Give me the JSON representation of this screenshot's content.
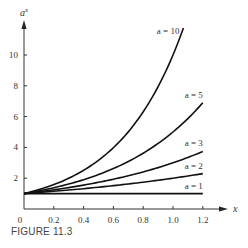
{
  "caption": "FIGURE 11.3",
  "chart_data": {
    "type": "line",
    "title": "",
    "xlabel": "x",
    "ylabel": "a^x",
    "xlim": [
      0,
      1.2
    ],
    "ylim": [
      0,
      12
    ],
    "x_ticks": [
      "0",
      "0.2",
      "0.4",
      "0.6",
      "0.8",
      "1.0",
      "1.2"
    ],
    "y_ticks": [
      "2",
      "4",
      "6",
      "8",
      "10"
    ],
    "grid": false,
    "legend": "inline labels at curve ends",
    "series": [
      {
        "name": "a = 1",
        "base": 1,
        "x": [
          0,
          0.2,
          0.4,
          0.6,
          0.8,
          1.0,
          1.2
        ],
        "values": [
          1,
          1,
          1,
          1,
          1,
          1,
          1
        ]
      },
      {
        "name": "a = 2",
        "base": 2,
        "x": [
          0,
          0.2,
          0.4,
          0.6,
          0.8,
          1.0,
          1.2
        ],
        "values": [
          1,
          1.15,
          1.32,
          1.52,
          1.74,
          2.0,
          2.3
        ]
      },
      {
        "name": "a = 3",
        "base": 3,
        "x": [
          0,
          0.2,
          0.4,
          0.6,
          0.8,
          1.0,
          1.2
        ],
        "values": [
          1,
          1.25,
          1.55,
          1.93,
          2.41,
          3.0,
          3.74
        ]
      },
      {
        "name": "a = 5",
        "base": 5,
        "x": [
          0,
          0.2,
          0.4,
          0.6,
          0.8,
          1.0,
          1.2
        ],
        "values": [
          1,
          1.38,
          1.9,
          2.63,
          3.62,
          5.0,
          6.9
        ]
      },
      {
        "name": "a = 10",
        "base": 10,
        "x": [
          0,
          0.2,
          0.4,
          0.6,
          0.8,
          1.0,
          1.07
        ],
        "values": [
          1,
          1.58,
          2.51,
          3.98,
          6.31,
          10.0,
          11.75
        ]
      }
    ]
  }
}
